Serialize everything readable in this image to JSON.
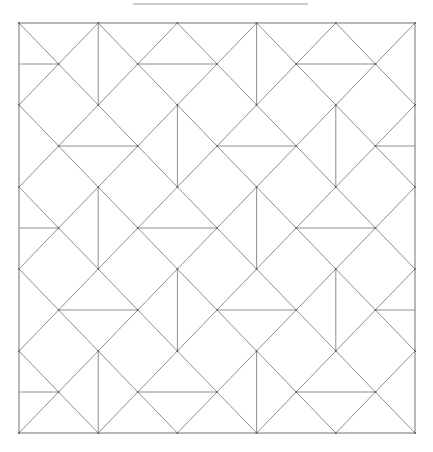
{
  "diagram": {
    "type": "geometric-tiling",
    "grid": {
      "columns": 10,
      "rows": 10
    },
    "colors": {
      "line": "#8e8e8e",
      "vertex": "#666666",
      "background": "#ffffff"
    },
    "vertical_dividers": [
      [
        [
          2,
          0
        ],
        [
          2,
          2
        ]
      ],
      [
        [
          6,
          0
        ],
        [
          6,
          2
        ]
      ],
      [
        [
          4,
          2
        ],
        [
          4,
          4
        ]
      ],
      [
        [
          8,
          2
        ],
        [
          8,
          4
        ]
      ],
      [
        [
          2,
          4
        ],
        [
          2,
          6
        ]
      ],
      [
        [
          6,
          4
        ],
        [
          6,
          6
        ]
      ],
      [
        [
          4,
          6
        ],
        [
          4,
          8
        ]
      ],
      [
        [
          8,
          6
        ],
        [
          8,
          8
        ]
      ],
      [
        [
          2,
          8
        ],
        [
          2,
          10
        ]
      ],
      [
        [
          6,
          8
        ],
        [
          6,
          10
        ]
      ]
    ],
    "horizontal_dividers": [
      [
        [
          0,
          1
        ],
        [
          1,
          1
        ]
      ],
      [
        [
          3,
          1
        ],
        [
          5,
          1
        ]
      ],
      [
        [
          7,
          1
        ],
        [
          9,
          1
        ]
      ],
      [
        [
          1,
          3
        ],
        [
          3,
          3
        ]
      ],
      [
        [
          5,
          3
        ],
        [
          7,
          3
        ]
      ],
      [
        [
          9,
          3
        ],
        [
          10,
          3
        ]
      ],
      [
        [
          0,
          5
        ],
        [
          1,
          5
        ]
      ],
      [
        [
          3,
          5
        ],
        [
          5,
          5
        ]
      ],
      [
        [
          7,
          5
        ],
        [
          9,
          5
        ]
      ],
      [
        [
          1,
          7
        ],
        [
          3,
          7
        ]
      ],
      [
        [
          5,
          7
        ],
        [
          7,
          7
        ]
      ],
      [
        [
          9,
          7
        ],
        [
          10,
          7
        ]
      ],
      [
        [
          0,
          9
        ],
        [
          1,
          9
        ]
      ],
      [
        [
          3,
          9
        ],
        [
          5,
          9
        ]
      ],
      [
        [
          7,
          9
        ],
        [
          9,
          9
        ]
      ]
    ]
  }
}
